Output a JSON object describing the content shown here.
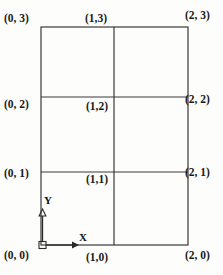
{
  "figure": {
    "type": "diagram",
    "kind": "coordinate-grid",
    "background_color": "#fdfdfc",
    "line_color": "#3a3a3a",
    "text_color": "#1a1a1a"
  },
  "grid": {
    "columns": 2,
    "rows": 3,
    "x_values": [
      0,
      1,
      2
    ],
    "y_values": [
      0,
      1,
      2,
      3
    ],
    "pixel_bounds": {
      "left": 41,
      "right": 188,
      "top": 27,
      "bottom": 245
    },
    "vertical_lines_px": [
      41,
      114,
      188
    ],
    "horizontal_lines_px": [
      27,
      97,
      172,
      245
    ]
  },
  "axes": {
    "x_label": "X",
    "y_label": "Y",
    "origin_label": "(0, 0)",
    "origin_marker": "square-node",
    "x_arrow": "arrow-right",
    "y_arrow": "arrow-up"
  },
  "labels": {
    "p03": "(0, 3)",
    "p13": "(1,3)",
    "p23": "(2, 3)",
    "p02": "(0, 2)",
    "p12": "(1,2)",
    "p22": "(2, 2)",
    "p01": "(0, 1)",
    "p11": "(1,1)",
    "p21": "(2, 1)",
    "p00": "(0, 0)",
    "p10": "(1,0)",
    "p20": "(2, 0)"
  }
}
